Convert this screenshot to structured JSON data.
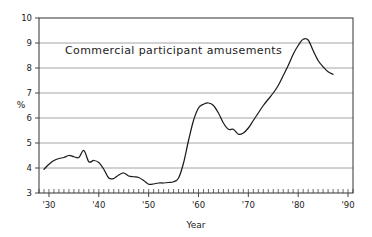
{
  "chart_data": {
    "type": "line",
    "title": "",
    "annotation": "Commercial participant amusements",
    "xlabel": "Year",
    "ylabel": "%",
    "xlim": [
      1928,
      1991
    ],
    "ylim": [
      3,
      10
    ],
    "grid": true,
    "legend_position": "none",
    "y_ticks": [
      3,
      4,
      5,
      6,
      7,
      8,
      9,
      10
    ],
    "y_tick_labels": [
      "3",
      "4",
      "5",
      "6",
      "7",
      "8",
      "9",
      "10"
    ],
    "x_ticks": [
      1930,
      1940,
      1950,
      1960,
      1970,
      1980,
      1990
    ],
    "x_tick_labels": [
      "'30",
      "'40",
      "'50",
      "'60",
      "'70",
      "'80",
      "'90"
    ],
    "x_minor_tick_interval": 1,
    "series": [
      {
        "name": "Commercial participant amusements",
        "color": "#1c1c1c",
        "x": [
          1929,
          1930,
          1931,
          1932,
          1933,
          1934,
          1935,
          1936,
          1937,
          1938,
          1939,
          1940,
          1941,
          1942,
          1943,
          1944,
          1945,
          1946,
          1947,
          1948,
          1949,
          1950,
          1951,
          1952,
          1953,
          1954,
          1955,
          1956,
          1957,
          1958,
          1959,
          1960,
          1961,
          1962,
          1963,
          1964,
          1965,
          1966,
          1967,
          1968,
          1969,
          1970,
          1971,
          1972,
          1973,
          1974,
          1975,
          1976,
          1977,
          1978,
          1979,
          1980,
          1981,
          1982,
          1983,
          1984,
          1985,
          1986,
          1987
        ],
        "values": [
          3.95,
          4.15,
          4.3,
          4.38,
          4.42,
          4.5,
          4.45,
          4.42,
          4.7,
          4.25,
          4.3,
          4.22,
          3.95,
          3.6,
          3.58,
          3.72,
          3.8,
          3.68,
          3.65,
          3.62,
          3.5,
          3.35,
          3.36,
          3.4,
          3.4,
          3.42,
          3.45,
          3.6,
          4.2,
          5.1,
          5.9,
          6.4,
          6.55,
          6.6,
          6.5,
          6.2,
          5.8,
          5.55,
          5.55,
          5.35,
          5.4,
          5.6,
          5.9,
          6.2,
          6.5,
          6.75,
          7.0,
          7.3,
          7.7,
          8.1,
          8.55,
          8.9,
          9.15,
          9.12,
          8.7,
          8.3,
          8.05,
          7.85,
          7.75
        ]
      }
    ]
  },
  "axes": {
    "x_axis_title": "Year",
    "y_axis_title": "%"
  }
}
